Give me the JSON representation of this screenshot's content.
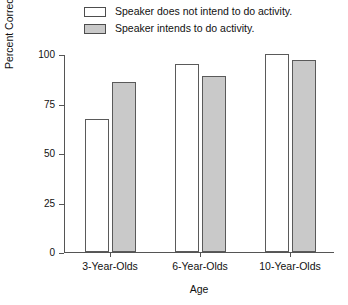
{
  "chart_data": {
    "type": "bar",
    "title": "",
    "xlabel": "Age",
    "ylabel": "Percent Correct Choice of Scenario Outcome",
    "categories": [
      "3-Year-Olds",
      "6-Year-Olds",
      "10-Year-Olds"
    ],
    "series": [
      {
        "name": "Speaker does not intend to do activity.",
        "color": "#ffffff",
        "values": [
          67,
          95,
          100
        ]
      },
      {
        "name": "Speaker intends to do activity.",
        "color": "#c9c9c9",
        "values": [
          86,
          89,
          97
        ]
      }
    ],
    "ylim": [
      0,
      100
    ],
    "yticks": [
      0,
      25,
      50,
      75,
      100
    ],
    "ytick_labels": [
      "0",
      "25",
      "50",
      "75",
      "100"
    ],
    "grid": false,
    "legend_position": "top"
  },
  "legend": {
    "items": [
      {
        "label": "Speaker does not intend to do activity.",
        "swatch": "white"
      },
      {
        "label": "Speaker intends to do activity.",
        "swatch": "gray"
      }
    ]
  },
  "axes": {
    "y_title": "Percent Correct Choice of Scenario Outcome",
    "x_title": "Age",
    "y_ticks": [
      "100",
      "75",
      "50",
      "25",
      "0"
    ],
    "x_ticks": [
      "3-Year-Olds",
      "6-Year-Olds",
      "10-Year-Olds"
    ]
  },
  "colors": {
    "bar_white": "#ffffff",
    "bar_gray": "#c9c9c9",
    "bar_outline": "#5a5a5a",
    "axis": "#555555",
    "text": "#111111"
  }
}
